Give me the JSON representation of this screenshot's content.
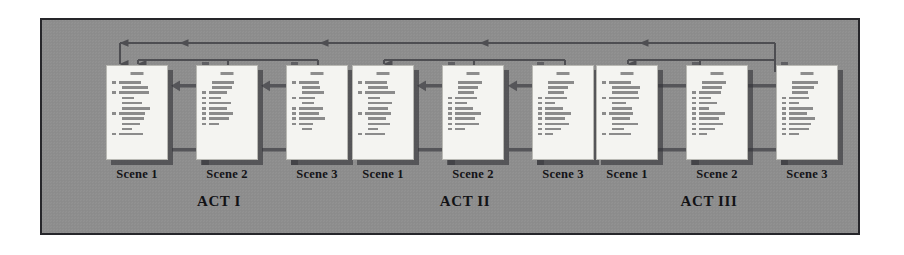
{
  "diagram": {
    "panel_color": "#8e8e8e",
    "panel_border_color": "#26262a",
    "page_color": "#f4f4f1",
    "arrow_color": "#555559",
    "connector_color": "#4e4e52",
    "divider_color": "#5f5f63",
    "text_color": "#121215"
  },
  "acts": [
    {
      "title": "ACT I",
      "scenes": [
        {
          "label": "Scene 1",
          "lines": [
            [
              4,
              22
            ],
            [
              0,
              26
            ],
            [
              4,
              30
            ],
            [
              0,
              12
            ],
            [
              0,
              20
            ],
            [
              0,
              28
            ],
            [
              4,
              26
            ],
            [
              0,
              22
            ],
            [
              0,
              18
            ],
            [
              0,
              10
            ],
            [
              4,
              24
            ]
          ]
        },
        {
          "label": "Scene 2",
          "lines": [
            [
              0,
              22
            ],
            [
              0,
              20
            ],
            [
              4,
              18
            ],
            [
              4,
              12
            ],
            [
              4,
              22
            ],
            [
              4,
              18
            ],
            [
              4,
              24
            ],
            [
              4,
              20
            ],
            [
              4,
              10
            ]
          ]
        },
        {
          "label": "Scene 3",
          "lines": [
            [
              4,
              20
            ],
            [
              0,
              18
            ],
            [
              0,
              22
            ],
            [
              4,
              16
            ],
            [
              0,
              12
            ],
            [
              4,
              24
            ],
            [
              4,
              20
            ],
            [
              4,
              26
            ],
            [
              4,
              14
            ],
            [
              0,
              10
            ]
          ]
        }
      ]
    },
    {
      "title": "ACT II",
      "scenes": [
        {
          "label": "Scene 1",
          "lines": [
            [
              4,
              22
            ],
            [
              0,
              20
            ],
            [
              4,
              30
            ],
            [
              0,
              12
            ],
            [
              0,
              24
            ],
            [
              0,
              20
            ],
            [
              4,
              26
            ],
            [
              0,
              18
            ],
            [
              0,
              22
            ],
            [
              0,
              10
            ],
            [
              4,
              20
            ]
          ]
        },
        {
          "label": "Scene 2",
          "lines": [
            [
              0,
              24
            ],
            [
              0,
              20
            ],
            [
              0,
              16
            ],
            [
              4,
              22
            ],
            [
              4,
              12
            ],
            [
              4,
              18
            ],
            [
              4,
              26
            ],
            [
              4,
              20
            ],
            [
              4,
              24
            ],
            [
              4,
              10
            ]
          ]
        },
        {
          "label": "Scene 3",
          "lines": [
            [
              0,
              26
            ],
            [
              0,
              20
            ],
            [
              0,
              16
            ],
            [
              4,
              22
            ],
            [
              4,
              10
            ],
            [
              4,
              18
            ],
            [
              4,
              26
            ],
            [
              4,
              20
            ],
            [
              4,
              24
            ],
            [
              4,
              16
            ],
            [
              4,
              8
            ]
          ]
        }
      ]
    },
    {
      "title": "ACT III",
      "scenes": [
        {
          "label": "Scene 1",
          "lines": [
            [
              4,
              22
            ],
            [
              0,
              28
            ],
            [
              0,
              26
            ],
            [
              4,
              30
            ],
            [
              0,
              14
            ],
            [
              0,
              20
            ],
            [
              4,
              24
            ],
            [
              0,
              18
            ],
            [
              0,
              26
            ],
            [
              0,
              12
            ],
            [
              4,
              22
            ]
          ]
        },
        {
          "label": "Scene 2",
          "lines": [
            [
              0,
              24
            ],
            [
              0,
              20
            ],
            [
              4,
              22
            ],
            [
              4,
              12
            ],
            [
              4,
              18
            ],
            [
              4,
              10
            ],
            [
              4,
              26
            ],
            [
              4,
              20
            ],
            [
              4,
              24
            ],
            [
              4,
              16
            ],
            [
              4,
              8
            ]
          ]
        },
        {
          "label": "Scene 3",
          "lines": [
            [
              0,
              26
            ],
            [
              0,
              22
            ],
            [
              0,
              16
            ],
            [
              4,
              20
            ],
            [
              4,
              10
            ],
            [
              4,
              24
            ],
            [
              4,
              18
            ],
            [
              4,
              26
            ],
            [
              4,
              22
            ],
            [
              4,
              20
            ],
            [
              4,
              10
            ]
          ]
        }
      ]
    }
  ],
  "connectors": {
    "global_return": "long horizontal return line across all acts with leftward arrowheads",
    "act_return": "per-act bracket return line into the act's first scene",
    "forward_flow": "rightward arrow between consecutive scenes",
    "backward_flow": "leftward arrow between consecutive scenes"
  }
}
